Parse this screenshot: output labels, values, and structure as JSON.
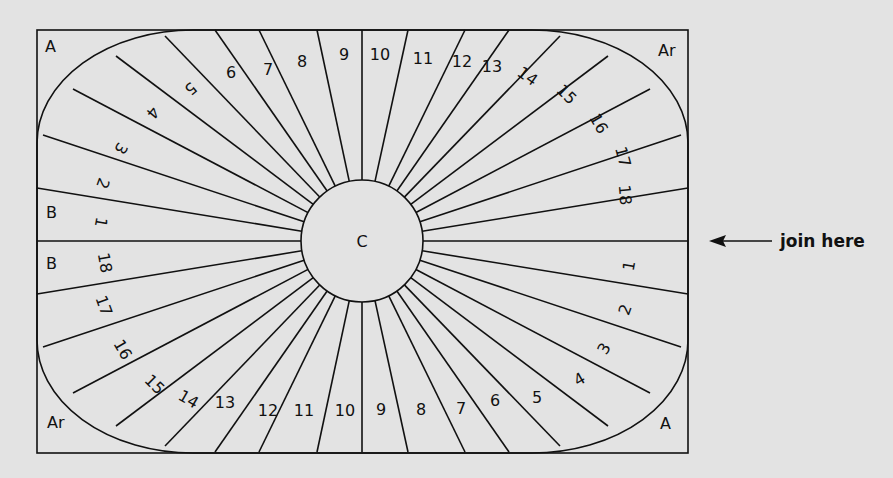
{
  "diagram": {
    "type": "quilt-block-template",
    "center_label": "C",
    "corner_labels": {
      "top_left": "A",
      "top_right": "Ar",
      "bottom_left": "Ar",
      "bottom_right": "A"
    },
    "side_labels": {
      "left_upper": "B",
      "left_lower": "B"
    },
    "top_half_segments": [
      "1",
      "2",
      "3",
      "4",
      "5",
      "6",
      "7",
      "8",
      "9",
      "10",
      "11",
      "12",
      "13",
      "14",
      "15",
      "16",
      "17",
      "18"
    ],
    "bottom_half_segments": [
      "18",
      "17",
      "16",
      "15",
      "14",
      "13",
      "12",
      "11",
      "10",
      "9",
      "8",
      "7",
      "6",
      "5",
      "4",
      "3",
      "2",
      "1"
    ],
    "annotation": {
      "text": "join here",
      "arrow": "left-arrow-icon"
    },
    "colors": {
      "background": "#e3e3e3",
      "line": "#111111"
    }
  }
}
